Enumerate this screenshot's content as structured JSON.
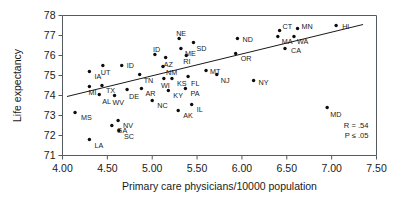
{
  "chart_data": {
    "type": "scatter",
    "title": "",
    "xlabel": "Primary care physicians/10000 population",
    "ylabel": "Life expectancy",
    "xlim": [
      4.0,
      7.5
    ],
    "ylim": [
      71,
      78
    ],
    "xticks": [
      "4.00",
      "4.50",
      "5.00",
      "5.50",
      "6.00",
      "6.50",
      "7.00",
      "7.50"
    ],
    "yticks": [
      "71",
      "72",
      "73",
      "74",
      "75",
      "76",
      "77",
      "78"
    ],
    "grid": false,
    "legend": "none",
    "annotations": [
      "R = .54",
      "P ≤ .05"
    ],
    "trend_line": {
      "x0": 4.05,
      "y0": 73.95,
      "x1": 7.35,
      "y1": 77.55
    },
    "point_label_field": "state",
    "points": [
      {
        "state": "MS",
        "x": 4.14,
        "y": 73.15,
        "lx": 6,
        "ly": 7
      },
      {
        "state": "IA",
        "x": 4.3,
        "y": 75.2,
        "lx": 5,
        "ly": 7
      },
      {
        "state": "MI",
        "x": 4.3,
        "y": 74.45,
        "lx": -1,
        "ly": 8
      },
      {
        "state": "LA",
        "x": 4.3,
        "y": 71.8,
        "lx": 5,
        "ly": 8
      },
      {
        "state": "UT",
        "x": 4.45,
        "y": 75.5,
        "lx": -2,
        "ly": 9
      },
      {
        "state": "TX",
        "x": 4.44,
        "y": 74.5,
        "lx": 4,
        "ly": 7
      },
      {
        "state": "AL",
        "x": 4.41,
        "y": 74.05,
        "lx": 3,
        "ly": 9
      },
      {
        "state": "GA",
        "x": 4.55,
        "y": 72.5,
        "lx": 5,
        "ly": 7
      },
      {
        "state": "NV",
        "x": 4.62,
        "y": 72.75,
        "lx": 5,
        "ly": 7
      },
      {
        "state": "WV",
        "x": 4.58,
        "y": 74.0,
        "lx": -2,
        "ly": 9
      },
      {
        "state": "SC",
        "x": 4.63,
        "y": 72.25,
        "lx": 5,
        "ly": 8
      },
      {
        "state": "ID",
        "x": 4.66,
        "y": 75.5,
        "lx": 5,
        "ly": 2
      },
      {
        "state": "DE",
        "x": 4.72,
        "y": 74.3,
        "lx": 2,
        "ly": 9
      },
      {
        "state": "TN",
        "x": 4.86,
        "y": 75.05,
        "lx": 4,
        "ly": 8
      },
      {
        "state": "AR",
        "x": 4.88,
        "y": 74.35,
        "lx": 4,
        "ly": 7
      },
      {
        "state": "ID",
        "x": 5.03,
        "y": 76.05,
        "lx": -2,
        "ly": -3
      },
      {
        "state": "NC",
        "x": 5.0,
        "y": 73.75,
        "lx": 5,
        "ly": 7
      },
      {
        "state": "WI",
        "x": 5.13,
        "y": 74.85,
        "lx": -3,
        "ly": 9
      },
      {
        "state": "NM",
        "x": 5.12,
        "y": 75.45,
        "lx": 3,
        "ly": 8
      },
      {
        "state": "AZ",
        "x": 5.15,
        "y": 75.9,
        "lx": -2,
        "ly": 9
      },
      {
        "state": "KY",
        "x": 5.18,
        "y": 74.25,
        "lx": 5,
        "ly": 7
      },
      {
        "state": "KS",
        "x": 5.22,
        "y": 74.85,
        "lx": 5,
        "ly": 7
      },
      {
        "state": "AK",
        "x": 5.29,
        "y": 73.25,
        "lx": 5,
        "ly": 7
      },
      {
        "state": "NE",
        "x": 5.3,
        "y": 76.85,
        "lx": -3,
        "ly": -3
      },
      {
        "state": "ME",
        "x": 5.32,
        "y": 76.35,
        "lx": 4,
        "ly": 7
      },
      {
        "state": "PA",
        "x": 5.37,
        "y": 74.35,
        "lx": 5,
        "ly": 7
      },
      {
        "state": "FL",
        "x": 5.4,
        "y": 74.95,
        "lx": 3,
        "ly": 9
      },
      {
        "state": "RI",
        "x": 5.38,
        "y": 76.0,
        "lx": -3,
        "ly": 8
      },
      {
        "state": "SD",
        "x": 5.46,
        "y": 76.65,
        "lx": 3,
        "ly": 8
      },
      {
        "state": "IL",
        "x": 5.44,
        "y": 73.55,
        "lx": 5,
        "ly": 7
      },
      {
        "state": "MT",
        "x": 5.6,
        "y": 75.25,
        "lx": 4,
        "ly": 3
      },
      {
        "state": "NJ",
        "x": 5.72,
        "y": 75.05,
        "lx": 4,
        "ly": 8
      },
      {
        "state": "ND",
        "x": 5.95,
        "y": 76.85,
        "lx": 5,
        "ly": 3
      },
      {
        "state": "OR",
        "x": 5.93,
        "y": 76.1,
        "lx": 5,
        "ly": 7
      },
      {
        "state": "NY",
        "x": 6.13,
        "y": 74.75,
        "lx": 5,
        "ly": 4
      },
      {
        "state": "MA",
        "x": 6.4,
        "y": 76.95,
        "lx": 4,
        "ly": 7
      },
      {
        "state": "CT",
        "x": 6.42,
        "y": 77.25,
        "lx": 3,
        "ly": -2
      },
      {
        "state": "CA",
        "x": 6.48,
        "y": 76.35,
        "lx": 6,
        "ly": 4
      },
      {
        "state": "WA",
        "x": 6.58,
        "y": 76.95,
        "lx": 3,
        "ly": 7
      },
      {
        "state": "MN",
        "x": 6.62,
        "y": 77.35,
        "lx": 4,
        "ly": 0
      },
      {
        "state": "MD",
        "x": 6.95,
        "y": 73.4,
        "lx": 3,
        "ly": 9
      },
      {
        "state": "HI",
        "x": 7.05,
        "y": 77.5,
        "lx": 6,
        "ly": 3
      }
    ]
  }
}
